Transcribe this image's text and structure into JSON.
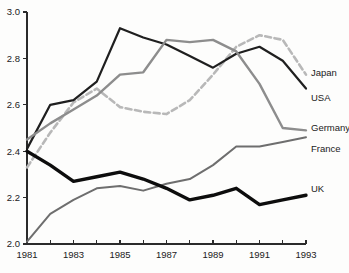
{
  "chart_data": {
    "type": "line",
    "title": "",
    "subtitle": "",
    "xlabel": "",
    "ylabel": "",
    "x": [
      1981,
      1982,
      1983,
      1984,
      1985,
      1986,
      1987,
      1988,
      1989,
      1990,
      1991,
      1992,
      1993
    ],
    "xlim": [
      1981,
      1993
    ],
    "ylim": [
      2.0,
      3.0
    ],
    "x_tick_labels": [
      "1981",
      "1983",
      "1985",
      "1987",
      "1989",
      "1991",
      "1993"
    ],
    "x_tick_values": [
      1981,
      1983,
      1985,
      1987,
      1989,
      1991,
      1993
    ],
    "x_minor_tick_values": [
      1982,
      1984,
      1986,
      1988,
      1990,
      1992
    ],
    "y_tick_labels": [
      "3.0",
      "2.8",
      "2.6",
      "2.4",
      "2.2",
      "2.0"
    ],
    "y_tick_values": [
      3.0,
      2.8,
      2.6,
      2.4,
      2.2,
      2.0
    ],
    "grid": false,
    "legend_position": "right-inline-labels",
    "series": [
      {
        "name": "Japan",
        "label": "Japan",
        "color": "#b8b8b8",
        "style": "dashed",
        "width": 2.6,
        "label_y": 2.74,
        "values": [
          2.33,
          2.48,
          2.61,
          2.67,
          2.59,
          2.57,
          2.56,
          2.62,
          2.73,
          2.85,
          2.9,
          2.88,
          2.73
        ]
      },
      {
        "name": "USA",
        "label": "USA",
        "color": "#1f1f1f",
        "style": "solid",
        "width": 2.2,
        "label_y": 2.63,
        "values": [
          2.41,
          2.6,
          2.62,
          2.7,
          2.93,
          2.89,
          2.86,
          2.81,
          2.76,
          2.82,
          2.85,
          2.79,
          2.67
        ]
      },
      {
        "name": "Germany",
        "label": "Germany",
        "color": "#8d8d8d",
        "style": "solid",
        "width": 2.4,
        "label_y": 2.5,
        "values": [
          2.45,
          2.52,
          2.58,
          2.64,
          2.73,
          2.74,
          2.88,
          2.87,
          2.88,
          2.83,
          2.69,
          2.5,
          2.49
        ]
      },
      {
        "name": "France",
        "label": "France",
        "color": "#6e6e6e",
        "style": "solid",
        "width": 2.0,
        "label_y": 2.41,
        "values": [
          2.01,
          2.13,
          2.19,
          2.24,
          2.25,
          2.23,
          2.26,
          2.28,
          2.34,
          2.42,
          2.42,
          2.44,
          2.46
        ]
      },
      {
        "name": "UK",
        "label": "UK",
        "color": "#0d0d0d",
        "style": "solid",
        "width": 3.4,
        "label_y": 2.24,
        "values": [
          2.4,
          2.34,
          2.27,
          2.29,
          2.31,
          2.28,
          2.24,
          2.19,
          2.21,
          2.24,
          2.17,
          2.19,
          2.21
        ]
      }
    ]
  },
  "geometry": {
    "plot_left": 27,
    "plot_right": 306,
    "plot_top": 12,
    "plot_bottom": 244,
    "label_x": 311
  }
}
